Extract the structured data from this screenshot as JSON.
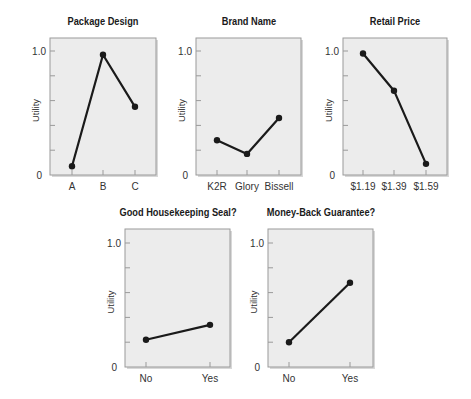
{
  "chart_data": [
    {
      "type": "line",
      "title": "Package Design",
      "xlabel": "",
      "ylabel": "Utility",
      "categories": [
        "A",
        "B",
        "C"
      ],
      "values": [
        0.07,
        0.97,
        0.55
      ],
      "ylim": [
        0,
        1.1
      ],
      "yticks": [
        0,
        0.2,
        0.4,
        0.6,
        0.8,
        1.0
      ],
      "ytick_labels": {
        "0": "0",
        "1.0": "1.0"
      },
      "grid": false,
      "legend": null
    },
    {
      "type": "line",
      "title": "Brand Name",
      "xlabel": "",
      "ylabel": "Utility",
      "categories": [
        "K2R",
        "Glory",
        "Bissell"
      ],
      "values": [
        0.28,
        0.17,
        0.46
      ],
      "ylim": [
        0,
        1.1
      ],
      "yticks": [
        0,
        0.2,
        0.4,
        0.6,
        0.8,
        1.0
      ],
      "ytick_labels": {
        "0": "0",
        "1.0": "1.0"
      },
      "grid": false,
      "legend": null
    },
    {
      "type": "line",
      "title": "Retail Price",
      "xlabel": "",
      "ylabel": "Utility",
      "categories": [
        "$1.19",
        "$1.39",
        "$1.59"
      ],
      "values": [
        0.98,
        0.68,
        0.09
      ],
      "ylim": [
        0,
        1.1
      ],
      "yticks": [
        0,
        0.2,
        0.4,
        0.6,
        0.8,
        1.0
      ],
      "ytick_labels": {
        "0": "0",
        "1.0": "1.0"
      },
      "grid": false,
      "legend": null
    },
    {
      "type": "line",
      "title": "Good Housekeeping Seal?",
      "xlabel": "",
      "ylabel": "Utility",
      "categories": [
        "No",
        "Yes"
      ],
      "values": [
        0.22,
        0.34
      ],
      "ylim": [
        0,
        1.1
      ],
      "yticks": [
        0,
        0.2,
        0.4,
        0.6,
        0.8,
        1.0
      ],
      "ytick_labels": {
        "0": "0",
        "1.0": "1.0"
      },
      "grid": false,
      "legend": null
    },
    {
      "type": "line",
      "title": "Money-Back Guarantee?",
      "xlabel": "",
      "ylabel": "Utility",
      "categories": [
        "No",
        "Yes"
      ],
      "values": [
        0.2,
        0.68
      ],
      "ylim": [
        0,
        1.1
      ],
      "yticks": [
        0,
        0.2,
        0.4,
        0.6,
        0.8,
        1.0
      ],
      "ytick_labels": {
        "0": "0",
        "1.0": "1.0"
      },
      "grid": false,
      "legend": null
    }
  ],
  "layout": [
    {
      "box": [
        50,
        38,
        156,
        175
      ],
      "x_positions": [
        72,
        103,
        135
      ]
    },
    {
      "box": [
        196,
        38,
        301,
        175
      ],
      "x_positions": [
        217,
        247,
        279
      ]
    },
    {
      "box": [
        343,
        38,
        447,
        175
      ],
      "x_positions": [
        363,
        394,
        426
      ]
    },
    {
      "box": [
        125,
        229,
        230,
        367
      ],
      "x_positions": [
        146,
        210
      ]
    },
    {
      "box": [
        268,
        229,
        373,
        367
      ],
      "x_positions": [
        289,
        350
      ]
    }
  ],
  "colors": {
    "plot_bg": "#ececec",
    "plot_border": "#9a9a9a",
    "line": "#1a1a1a",
    "tick_label": "#333333"
  }
}
